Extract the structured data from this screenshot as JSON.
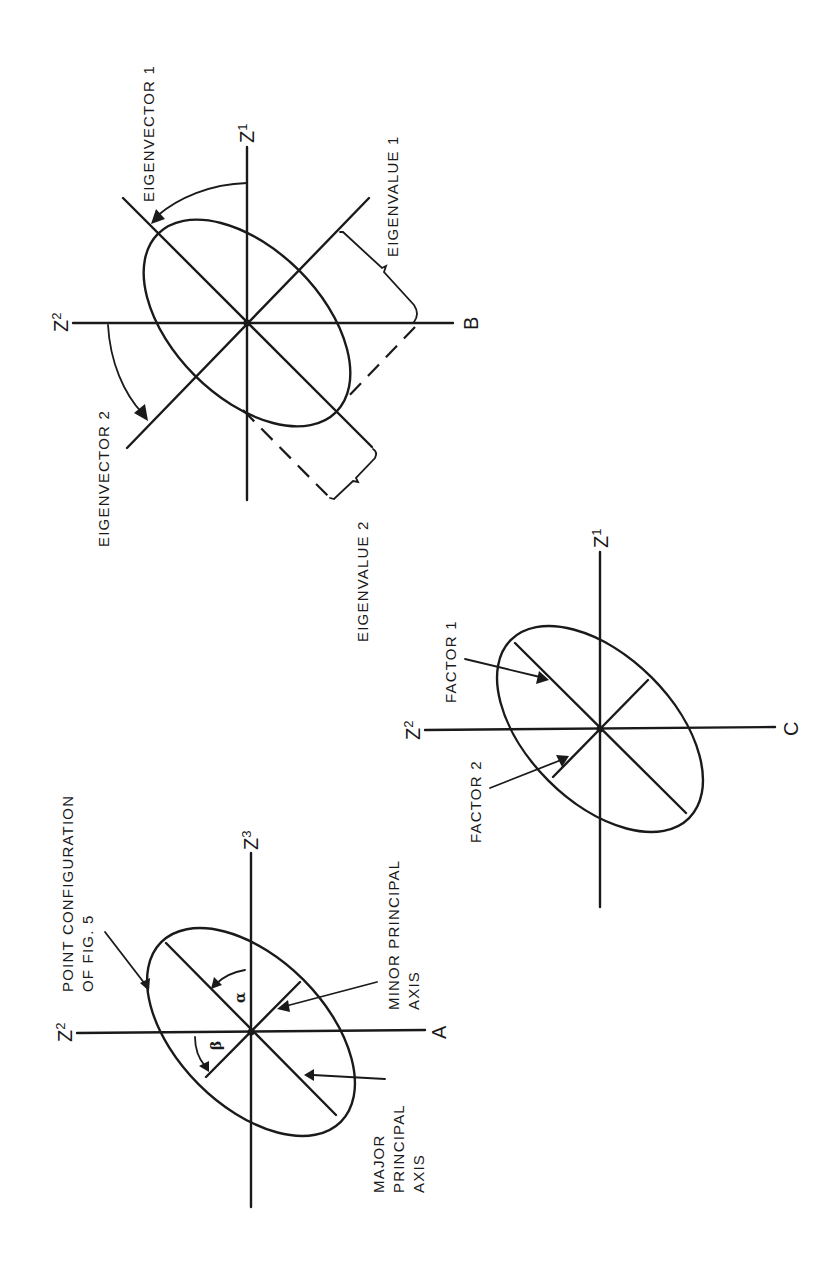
{
  "figure": {
    "orientation": "rotated 90 degrees counter-clockwise (text reads bottom-to-top)",
    "stroke_color": "#1a1a1a",
    "background": "#ffffff"
  },
  "panels": [
    {
      "id": "A",
      "panel_label": "A",
      "axis_labels": {
        "left": "Z",
        "left_sub": "2",
        "top": "Z",
        "top_sub": "3"
      },
      "annotations": {
        "point_config_line1": "POINT CONFIGURATION",
        "point_config_line2": "OF FIG. 5",
        "minor_line1": "MINOR PRINCIPAL",
        "minor_line2": "AXIS",
        "major_line1": "MAJOR",
        "major_line2": "PRINCIPAL",
        "major_line3": "AXIS",
        "alpha": "α",
        "beta": "β"
      }
    },
    {
      "id": "B",
      "panel_label": "B",
      "axis_labels": {
        "left": "Z",
        "left_sub": "2",
        "top": "Z",
        "top_sub": "1"
      },
      "annotations": {
        "eigenvector1": "EIGENVECTOR 1",
        "eigenvector2": "EIGENVECTOR 2",
        "eigenvalue1": "EIGENVALUE 1",
        "eigenvalue2": "EIGENVALUE 2"
      }
    },
    {
      "id": "C",
      "panel_label": "C",
      "axis_labels": {
        "left": "Z",
        "left_sub": "2",
        "top": "Z",
        "top_sub": "1"
      },
      "annotations": {
        "factor1": "FACTOR 1",
        "factor2": "FACTOR 2"
      }
    }
  ]
}
